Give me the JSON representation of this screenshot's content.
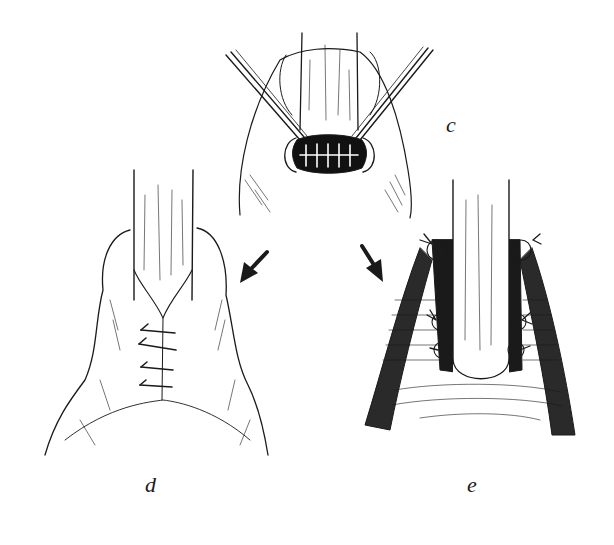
{
  "figure": {
    "panels": [
      {
        "id": "c",
        "label": "c",
        "description": "Retraction and suturing of wound opening around tube with forceps"
      },
      {
        "id": "d",
        "label": "d",
        "description": "Closed wound with interrupted sutures below the tube"
      },
      {
        "id": "e",
        "label": "e",
        "description": "Cross-section view showing sutures securing tissue around tube"
      }
    ],
    "arrows": [
      {
        "from": "c",
        "to": "d",
        "direction": "down-left"
      },
      {
        "from": "c",
        "to": "e",
        "direction": "down-right"
      }
    ],
    "colors": {
      "ink": "#1a1a1a",
      "background": "#ffffff"
    }
  }
}
